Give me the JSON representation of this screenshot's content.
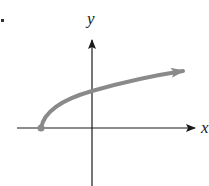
{
  "figure": {
    "type": "function-graph",
    "problem_marker": ".",
    "x_axis": {
      "label": "x",
      "color": "#1a1a1a"
    },
    "y_axis": {
      "label": "y",
      "color": "#1a1a1a"
    },
    "curve": {
      "color": "#8a8a8a",
      "start_point": "closed dot on negative x-axis",
      "end": "arrow pointing right",
      "shape": "sqrt"
    }
  }
}
